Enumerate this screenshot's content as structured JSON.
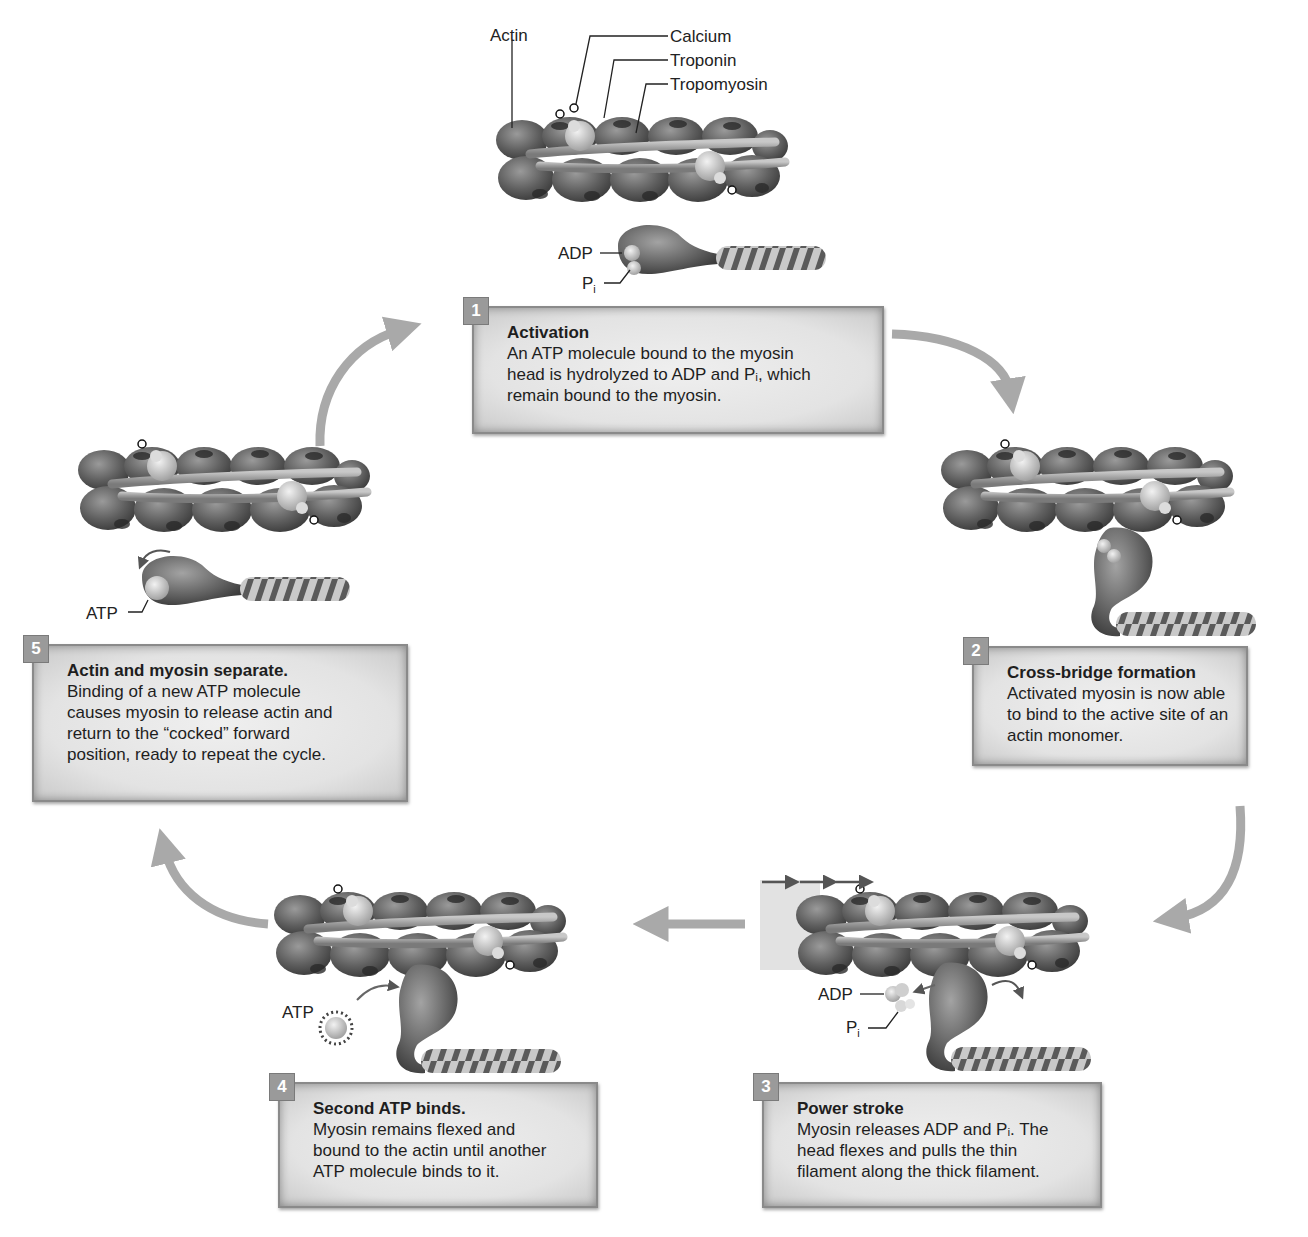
{
  "figure": {
    "type": "cycle-diagram",
    "arrow_color": "#a9a9a9",
    "box_fill": "#e6e6e6",
    "badge_color": "#9a9a9a"
  },
  "top_labels": {
    "actin": "Actin",
    "calcium": "Calcium",
    "troponin": "Troponin",
    "tropomyosin": "Tropomyosin",
    "adp": "ADP",
    "pi_base": "P",
    "pi_sub": "i"
  },
  "steps": [
    {
      "number": "1",
      "title": "Activation",
      "lines": [
        "An ATP molecule bound to the myosin",
        "head is hydrolyzed to ADP and Pᵢ, which",
        "remain bound to the myosin."
      ]
    },
    {
      "number": "2",
      "title": "Cross-bridge formation",
      "lines": [
        "Activated myosin is now able",
        "to bind to the active site of an",
        "actin monomer."
      ]
    },
    {
      "number": "3",
      "title": "Power stroke",
      "lines": [
        "Myosin releases ADP and Pᵢ. The",
        "head flexes and pulls the thin",
        "filament along the thick filament."
      ],
      "labels": {
        "adp": "ADP",
        "pi_base": "P",
        "pi_sub": "i"
      }
    },
    {
      "number": "4",
      "title": "Second ATP binds.",
      "lines": [
        "Myosin remains flexed and",
        "bound to the actin until another",
        "ATP molecule binds to it."
      ],
      "labels": {
        "atp": "ATP"
      }
    },
    {
      "number": "5",
      "title": "Actin and myosin separate.",
      "lines": [
        "Binding of a new ATP molecule",
        "causes myosin to release actin and",
        "return to the “cocked” forward",
        "position, ready to repeat the cycle."
      ],
      "labels": {
        "atp": "ATP"
      }
    }
  ]
}
